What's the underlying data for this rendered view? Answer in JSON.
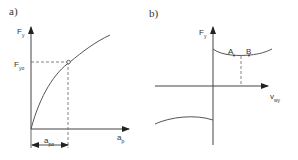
{
  "panel_a": {
    "label": "a)",
    "y_axis": {
      "symbol": "F",
      "subscript": "y"
    },
    "x_axis": {
      "symbol": "a",
      "subscript": "p"
    },
    "marked_y": {
      "symbol": "F",
      "subscript": "yo"
    },
    "marked_x": {
      "symbol": "a",
      "subscript": "po"
    }
  },
  "panel_b": {
    "label": "b)",
    "y_axis": {
      "symbol": "F",
      "subscript": "y"
    },
    "x_axis": {
      "symbol": "v",
      "subscript": "wy"
    },
    "point_a": "A",
    "point_b": "B"
  },
  "colors": {
    "line": "#444444",
    "text": "#333333"
  }
}
